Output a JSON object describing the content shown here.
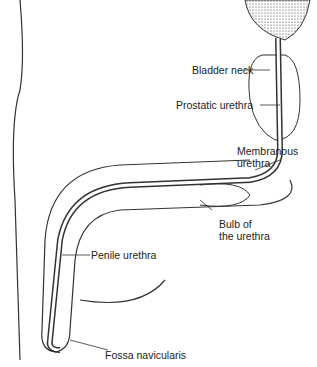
{
  "diagram": {
    "labels": [
      {
        "id": "bladder-neck",
        "text": "Bladder neck"
      },
      {
        "id": "prostatic-urethra",
        "text": "Prostatic urethra"
      },
      {
        "id": "membranous-urethra",
        "line1": "Membranous",
        "line2": "urethra"
      },
      {
        "id": "bulb-of-urethra",
        "line1": "Bulb of",
        "line2": "the urethra"
      },
      {
        "id": "penile-urethra",
        "text": "Penile urethra"
      },
      {
        "id": "fossa-navicularis",
        "text": "Fossa navicularis"
      }
    ]
  }
}
